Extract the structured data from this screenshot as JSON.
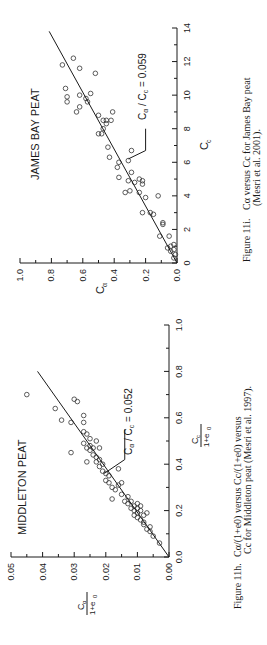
{
  "chart_data": [
    {
      "type": "scatter",
      "panel_title": "JAMES BAY PEAT",
      "xlabel": "Cc",
      "xlabel_main": "C",
      "xlabel_sub": "c",
      "ylabel": "Cα",
      "ylabel_main": "C",
      "ylabel_sub": "α",
      "xlim": [
        0,
        14
      ],
      "ylim": [
        0,
        1.0
      ],
      "x_ticks": [
        "0",
        "2",
        "4",
        "6",
        "8",
        "10",
        "12",
        "14"
      ],
      "y_ticks": [
        "0.0",
        "0.2",
        "0.4",
        "0.6",
        "0.8",
        "1.0"
      ],
      "fit_line": {
        "label": "Cα / Cc = 0.059",
        "slope": 0.059,
        "x_end": 13.8
      },
      "annotation": "Cα / Cc = 0.059",
      "points": [
        [
          0.3,
          0.02
        ],
        [
          0.5,
          0.01
        ],
        [
          0.7,
          0.04
        ],
        [
          0.8,
          0.02
        ],
        [
          0.9,
          0.06
        ],
        [
          1.0,
          0.04
        ],
        [
          1.1,
          0.02
        ],
        [
          1.6,
          0.05
        ],
        [
          1.6,
          0.11
        ],
        [
          2.3,
          0.09
        ],
        [
          2.4,
          0.09
        ],
        [
          2.9,
          0.15
        ],
        [
          3.0,
          0.17
        ],
        [
          3.0,
          0.22
        ],
        [
          3.9,
          0.2
        ],
        [
          4.0,
          0.12
        ],
        [
          4.2,
          0.33
        ],
        [
          4.2,
          0.24
        ],
        [
          4.3,
          0.3
        ],
        [
          4.7,
          0.22
        ],
        [
          4.8,
          0.27
        ],
        [
          4.9,
          0.22
        ],
        [
          4.9,
          0.31
        ],
        [
          5.0,
          0.24
        ],
        [
          5.1,
          0.37
        ],
        [
          5.4,
          0.29
        ],
        [
          5.7,
          0.38
        ],
        [
          6.0,
          0.37
        ],
        [
          6.1,
          0.31
        ],
        [
          6.3,
          0.43
        ],
        [
          6.7,
          0.29
        ],
        [
          6.9,
          0.44
        ],
        [
          7.7,
          0.48
        ],
        [
          7.7,
          0.5
        ],
        [
          8.0,
          0.47
        ],
        [
          8.3,
          0.45
        ],
        [
          8.5,
          0.47
        ],
        [
          8.5,
          0.42
        ],
        [
          8.5,
          0.45
        ],
        [
          8.8,
          0.5
        ],
        [
          9.0,
          0.41
        ],
        [
          9.0,
          0.64
        ],
        [
          9.3,
          0.62
        ],
        [
          9.6,
          0.57
        ],
        [
          9.6,
          0.7
        ],
        [
          9.8,
          0.58
        ],
        [
          9.9,
          0.7
        ],
        [
          10.0,
          0.62
        ],
        [
          10.1,
          0.55
        ],
        [
          10.4,
          0.71
        ],
        [
          11.3,
          0.52
        ],
        [
          11.6,
          0.62
        ],
        [
          11.8,
          0.73
        ],
        [
          12.2,
          0.66
        ]
      ],
      "caption_label": "Figure 11i.",
      "caption_line1": "Cα versus Cc for James Bay peat",
      "caption_line2": "(Mesri et al. 2001)."
    },
    {
      "type": "scatter",
      "panel_title": "MIDDLETON PEAT",
      "xlabel": "Cc/(1+e0)",
      "xlabel_num": "C",
      "xlabel_num_sub": "c",
      "xlabel_den": "1+e",
      "xlabel_den_sub": "0",
      "ylabel": "Cα/(1+e0)",
      "ylabel_num": "C",
      "ylabel_num_sub": "α",
      "ylabel_den": "1+e",
      "ylabel_den_sub": "0",
      "xlim": [
        0,
        1.0
      ],
      "ylim": [
        0,
        0.05
      ],
      "x_ticks": [
        "0.0",
        "0.2",
        "0.4",
        "0.6",
        "0.8",
        "1.0"
      ],
      "y_ticks": [
        "0.00",
        "0.01",
        "0.02",
        "0.03",
        "0.04",
        "0.05"
      ],
      "fit_line": {
        "label": "Cα / Cc = 0.052",
        "slope": 0.052,
        "x_end": 0.8
      },
      "annotation": "Cα / Cc = 0.052",
      "points": [
        [
          0.06,
          0.003
        ],
        [
          0.09,
          0.005
        ],
        [
          0.11,
          0.006
        ],
        [
          0.12,
          0.007
        ],
        [
          0.13,
          0.006
        ],
        [
          0.14,
          0.008
        ],
        [
          0.15,
          0.008
        ],
        [
          0.16,
          0.009
        ],
        [
          0.17,
          0.01
        ],
        [
          0.18,
          0.011
        ],
        [
          0.18,
          0.008
        ],
        [
          0.19,
          0.007
        ],
        [
          0.19,
          0.01
        ],
        [
          0.2,
          0.009
        ],
        [
          0.2,
          0.011
        ],
        [
          0.21,
          0.01
        ],
        [
          0.21,
          0.012
        ],
        [
          0.22,
          0.009
        ],
        [
          0.22,
          0.011
        ],
        [
          0.23,
          0.01
        ],
        [
          0.23,
          0.013
        ],
        [
          0.24,
          0.012
        ],
        [
          0.24,
          0.014
        ],
        [
          0.25,
          0.018
        ],
        [
          0.26,
          0.013
        ],
        [
          0.27,
          0.015
        ],
        [
          0.29,
          0.017
        ],
        [
          0.3,
          0.018
        ],
        [
          0.31,
          0.016
        ],
        [
          0.32,
          0.015
        ],
        [
          0.32,
          0.019
        ],
        [
          0.33,
          0.02
        ],
        [
          0.35,
          0.019
        ],
        [
          0.36,
          0.02
        ],
        [
          0.37,
          0.021
        ],
        [
          0.38,
          0.016
        ],
        [
          0.39,
          0.022
        ],
        [
          0.4,
          0.021
        ],
        [
          0.41,
          0.023
        ],
        [
          0.41,
          0.026
        ],
        [
          0.42,
          0.022
        ],
        [
          0.43,
          0.023
        ],
        [
          0.44,
          0.024
        ],
        [
          0.45,
          0.031
        ],
        [
          0.46,
          0.025
        ],
        [
          0.47,
          0.022
        ],
        [
          0.47,
          0.024
        ],
        [
          0.47,
          0.026
        ],
        [
          0.48,
          0.025
        ],
        [
          0.49,
          0.027
        ],
        [
          0.5,
          0.023
        ],
        [
          0.51,
          0.025
        ],
        [
          0.53,
          0.026
        ],
        [
          0.54,
          0.027
        ],
        [
          0.58,
          0.027
        ],
        [
          0.58,
          0.031
        ],
        [
          0.59,
          0.034
        ],
        [
          0.61,
          0.027
        ],
        [
          0.64,
          0.036
        ],
        [
          0.67,
          0.029
        ],
        [
          0.68,
          0.03
        ],
        [
          0.7,
          0.045
        ]
      ],
      "caption_label": "Figure 11h.",
      "caption_line1": "Cα/(1+e0) versus Cc/(1+e0) versus",
      "caption_line2": "Cc for Middleton peat (Mesri et al. 1997)."
    }
  ]
}
